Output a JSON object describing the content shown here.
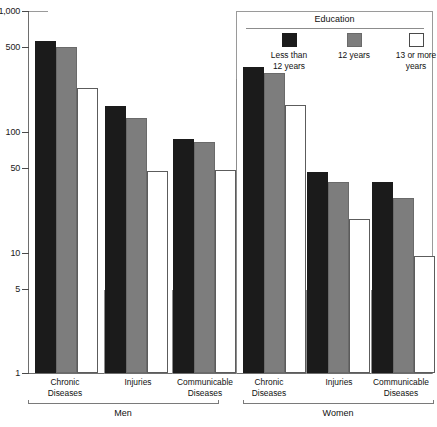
{
  "chart_data": {
    "type": "bar",
    "title": "",
    "xlabel": "",
    "ylabel": "",
    "yscale": "log",
    "ylim": [
      1,
      1000
    ],
    "ytick_labels": [
      "1,000",
      "500",
      "100",
      "50",
      "10",
      "5",
      "1"
    ],
    "ytick_values": [
      1000,
      500,
      100,
      50,
      10,
      5,
      1
    ],
    "grid": false,
    "legend_position": "top-right",
    "legend_title": "Education",
    "series": [
      {
        "name": "Less than 12 years",
        "color": "#1b1b1b",
        "values": [
          560,
          163,
          87,
          343,
          46,
          38
        ]
      },
      {
        "name": "12 years",
        "color": "#7d7d7d",
        "values": [
          500,
          130,
          82,
          306,
          38,
          28
        ]
      },
      {
        "name": "13 or more years",
        "color": "#ffffff",
        "values": [
          230,
          47,
          48,
          166,
          19,
          9.3
        ]
      }
    ],
    "categories": [
      "Chronic Diseases",
      "Injuries",
      "Communicable Diseases",
      "Chronic Diseases",
      "Injuries",
      "Communicable Diseases"
    ],
    "groups": [
      {
        "name": "Men",
        "categories": [
          "Chronic Diseases",
          "Injuries",
          "Communicable Diseases"
        ]
      },
      {
        "name": "Women",
        "categories": [
          "Chronic Diseases",
          "Injuries",
          "Communicable Diseases"
        ]
      }
    ]
  },
  "yaxis": {
    "ticks": [
      {
        "label": "1,000",
        "value": 1000
      },
      {
        "label": "500",
        "value": 500
      },
      {
        "label": "100",
        "value": 100
      },
      {
        "label": "50",
        "value": 50
      },
      {
        "label": "10",
        "value": 10
      },
      {
        "label": "5",
        "value": 5
      },
      {
        "label": "1",
        "value": 1
      }
    ]
  },
  "xaxis": {
    "categories": [
      {
        "line1": "Chronic",
        "line2": "Diseases"
      },
      {
        "line1": "Injuries",
        "line2": ""
      },
      {
        "line1": "Communicable",
        "line2": "Diseases"
      },
      {
        "line1": "Chronic",
        "line2": "Diseases"
      },
      {
        "line1": "Injuries",
        "line2": ""
      },
      {
        "line1": "Communicable",
        "line2": "Diseases"
      }
    ],
    "groups": [
      {
        "label": "Men"
      },
      {
        "label": "Women"
      }
    ]
  },
  "legend": {
    "title": "Education",
    "items": [
      {
        "label_line1": "Less than",
        "label_line2": "12 years",
        "swatch": "dark"
      },
      {
        "label_line1": "12 years",
        "label_line2": "",
        "swatch": "gray"
      },
      {
        "label_line1": "13 or more",
        "label_line2": "years",
        "swatch": "white"
      }
    ]
  },
  "colors": {
    "less_than_12": "#1b1b1b",
    "twelve_years": "#7d7d7d",
    "thirteen_or_more": "#ffffff",
    "axis": "#6e6e6e",
    "text": "#111111"
  }
}
